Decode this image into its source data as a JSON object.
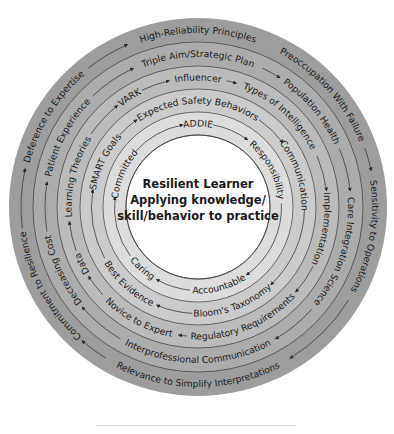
{
  "center": {
    "lines": [
      "Resilient Learner",
      "Applying knowledge/",
      "skill/behavior to practice"
    ]
  },
  "colors": {
    "ring1": "#9d9d9d",
    "ring2": "#acacac",
    "ring3": "#bbbbbb",
    "ring4": "#cbcbcb",
    "ring5": "#dcdcdc",
    "core": "#ffffff",
    "line": "#3a3a3a",
    "text": "#1a1a1a"
  },
  "rings": [
    {
      "name": "outer",
      "labels": [
        {
          "text": "High-Reliability Principles",
          "angle": 0
        },
        {
          "text": "Preoccupation With Failure",
          "angle": 48
        },
        {
          "text": "Sensitivity to Operations",
          "angle": 100
        },
        {
          "text": "Relevance to Simplify Interpretations",
          "angle": 180
        },
        {
          "text": "Commitment to Resilience",
          "angle": 242
        },
        {
          "text": "Deference to Expertise",
          "angle": 302
        }
      ]
    },
    {
      "name": "second",
      "labels": [
        {
          "text": "Triple Aim/Strategic Plan",
          "angle": 0
        },
        {
          "text": "Population Health",
          "angle": 50
        },
        {
          "text": "Care Integration Science",
          "angle": 108
        },
        {
          "text": "Interprofessional Communication",
          "angle": 180
        },
        {
          "text": "Decreasing Cost",
          "angle": 245
        },
        {
          "text": "Patient Experience",
          "angle": 298
        }
      ]
    },
    {
      "name": "third",
      "labels": [
        {
          "text": "Influencer",
          "angle": 0
        },
        {
          "text": "Types of Intelligence",
          "angle": 42
        },
        {
          "text": "Implementation",
          "angle": 100
        },
        {
          "text": "Regulatory Requirements",
          "angle": 158
        },
        {
          "text": "Novice to Expert",
          "angle": 208
        },
        {
          "text": "Data",
          "angle": 244
        },
        {
          "text": "Learning Theories",
          "angle": 284
        },
        {
          "text": "VARK",
          "angle": 328
        }
      ]
    },
    {
      "name": "fourth",
      "labels": [
        {
          "text": "Expected Safety Behaviors",
          "angle": 0
        },
        {
          "text": "Communication",
          "angle": 72
        },
        {
          "text": "Bloom's Taxonomy",
          "angle": 160
        },
        {
          "text": "Best Evidence",
          "angle": 222
        },
        {
          "text": "SMART Goals",
          "angle": 296
        }
      ]
    },
    {
      "name": "fifth",
      "labels": [
        {
          "text": "ADDIE",
          "angle": 0
        },
        {
          "text": "Responsibility",
          "angle": 62
        },
        {
          "text": "Accountable",
          "angle": 165
        },
        {
          "text": "Caring",
          "angle": 222
        },
        {
          "text": "Committed",
          "angle": 294
        }
      ]
    }
  ]
}
